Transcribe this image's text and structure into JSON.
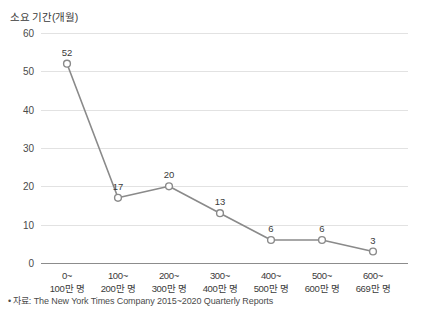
{
  "chart_data": {
    "type": "line",
    "title": "소요 기간(개월)",
    "xlabel": "",
    "ylabel": "소요 기간(개월)",
    "ylim": [
      0,
      60
    ],
    "yticks": [
      0,
      10,
      20,
      30,
      40,
      50,
      60
    ],
    "grid": true,
    "legend": "none",
    "categories": [
      "0~\n100만 명",
      "100~\n200만 명",
      "200~\n300만 명",
      "300~\n400만 명",
      "400~\n500만 명",
      "500~\n600만 명",
      "600~\n669만 명"
    ],
    "category_lines": [
      {
        "line1": "0~",
        "line2": "100만 명"
      },
      {
        "line1": "100~",
        "line2": "200만 명"
      },
      {
        "line1": "200~",
        "line2": "300만 명"
      },
      {
        "line1": "300~",
        "line2": "400만 명"
      },
      {
        "line1": "400~",
        "line2": "500만 명"
      },
      {
        "line1": "500~",
        "line2": "600만 명"
      },
      {
        "line1": "600~",
        "line2": "669만 명"
      }
    ],
    "values": [
      52,
      17,
      20,
      13,
      6,
      6,
      3
    ],
    "data_labels": [
      "52",
      "17",
      "20",
      "13",
      "6",
      "6",
      "3"
    ],
    "series": [
      {
        "name": "소요 기간(개월)",
        "values": [
          52,
          17,
          20,
          13,
          6,
          6,
          3
        ]
      }
    ],
    "colors": {
      "line": "#8a8a8a",
      "marker_fill": "#ffffff",
      "marker_stroke": "#8a8a8a",
      "grid": "#e2e2e2",
      "axis": "#8c8c8c",
      "text": "#3a3a3a"
    }
  },
  "footnote": {
    "bullet": "•",
    "text": "자료: The New York Times Company 2015~2020 Quarterly Reports"
  }
}
